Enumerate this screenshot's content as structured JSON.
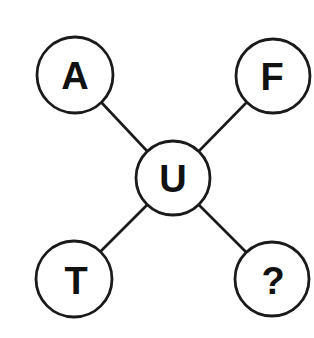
{
  "puzzle": {
    "type": "letter-star-puzzle",
    "center": {
      "label": "U",
      "cx": 173,
      "cy": 178,
      "r": 37
    },
    "nodes": [
      {
        "id": "top-left",
        "label": "A",
        "cx": 75,
        "cy": 75,
        "r": 38
      },
      {
        "id": "top-right",
        "label": "F",
        "cx": 273,
        "cy": 76,
        "r": 37
      },
      {
        "id": "bottom-left",
        "label": "T",
        "cx": 74,
        "cy": 279,
        "r": 38
      },
      {
        "id": "bottom-right",
        "label": "?",
        "cx": 272,
        "cy": 279,
        "r": 37
      }
    ],
    "colors": {
      "stroke": "#1a1a1a",
      "text": "#111111",
      "background": "#ffffff"
    }
  }
}
